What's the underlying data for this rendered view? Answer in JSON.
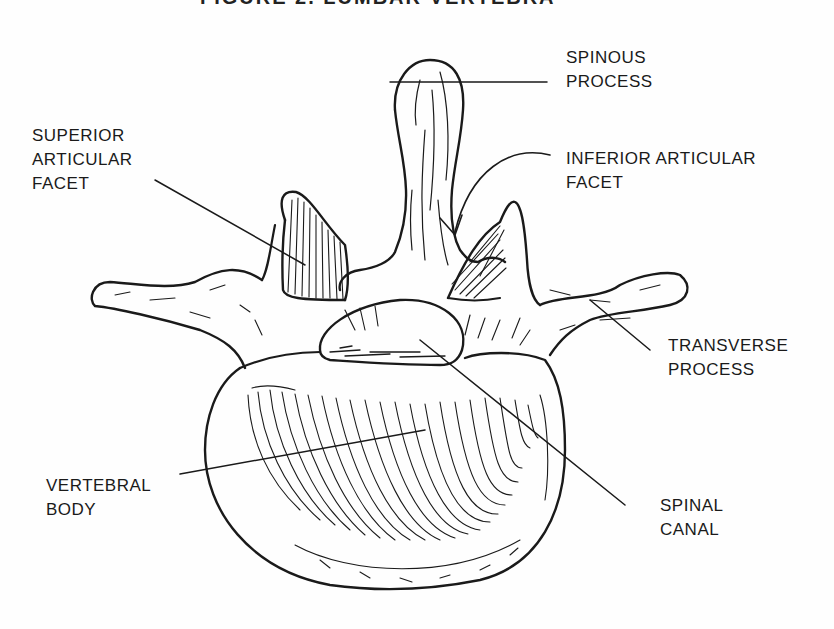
{
  "figure": {
    "title": "FIGURE 2. LUMBAR VERTEBRA",
    "line_color": "#1a1a1a",
    "background": "#fefefe"
  },
  "labels": {
    "spinous_process": {
      "line1": "SPINOUS",
      "line2": "PROCESS"
    },
    "superior_articular_facet": {
      "line1": "SUPERIOR",
      "line2": "ARTICULAR",
      "line3": "FACET"
    },
    "inferior_articular_facet": {
      "line1": "INFERIOR ARTICULAR",
      "line2": "FACET"
    },
    "transverse_process": {
      "line1": "TRANSVERSE",
      "line2": "PROCESS"
    },
    "vertebral_body": {
      "line1": "VERTEBRAL",
      "line2": "BODY"
    },
    "spinal_canal": {
      "line1": "SPINAL",
      "line2": "CANAL"
    }
  }
}
